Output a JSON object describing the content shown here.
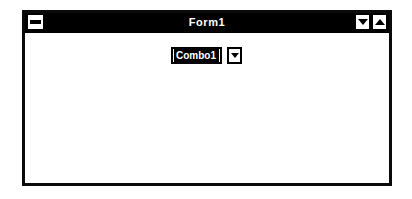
{
  "window": {
    "title": "Form1",
    "system_menu_icon": "minimize-bar-icon",
    "buttons": [
      {
        "name": "minimize-button",
        "icon": "triangle-down-icon"
      },
      {
        "name": "maximize-button",
        "icon": "triangle-up-icon"
      }
    ]
  },
  "client": {
    "combo": {
      "value": "Combo1",
      "dropdown_icon": "triangle-down-icon"
    }
  },
  "colors": {
    "titlebar_bg": "#000000",
    "titlebar_text": "#ffffff",
    "client_bg": "#ffffff",
    "frame": "#0a0a0a",
    "selection_bg": "#000000",
    "selection_text": "#ffffff"
  }
}
